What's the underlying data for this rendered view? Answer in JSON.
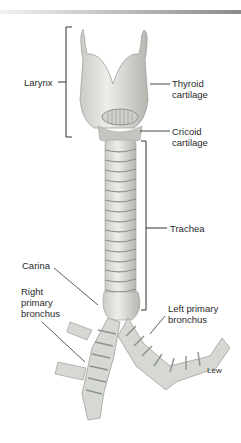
{
  "figure": {
    "labels": {
      "larynx": "Larynx",
      "thyroid_cartilage": "Thyroid\ncartilage",
      "cricoid_cartilage": "Cricoid\ncartilage",
      "trachea": "Trachea",
      "carina": "Carina",
      "right_primary_bronchus": "Right\nprimary\nbronchus",
      "left_primary_bronchus": "Left primary\nbronchus",
      "artist_credit": "Lew"
    },
    "colors": {
      "tissue": "#d9dcd6",
      "tissue_shade": "#a9ada6",
      "ring": "#8e928c",
      "leader_line": "#333333",
      "bracket": "#333333"
    }
  }
}
